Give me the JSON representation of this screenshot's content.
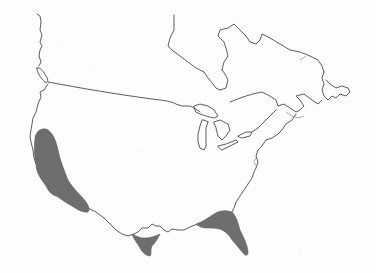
{
  "map": {
    "subject": "North America outline (United States and Canada)",
    "background_color": "#fdfdfd",
    "outline_color": "#4a4a4a",
    "shaded_regions": [
      {
        "id": "california-baja",
        "label": "",
        "fill": "#6e6e6e"
      },
      {
        "id": "south-texas",
        "label": "",
        "fill": "#6e6e6e"
      },
      {
        "id": "florida-gulf",
        "label": "",
        "fill": "#6e6e6e"
      }
    ],
    "features": [
      "us-canada-border",
      "vancouver-island",
      "hudson-bay",
      "great-lakes",
      "atlantic-coast",
      "gulf-coast",
      "pacific-coast"
    ]
  }
}
